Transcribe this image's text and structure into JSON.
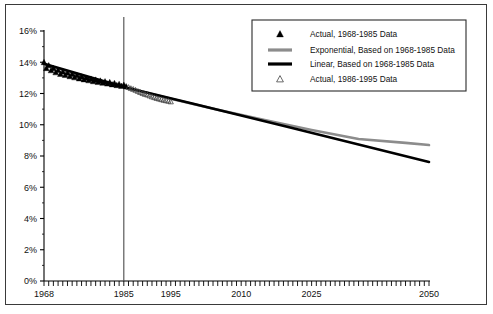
{
  "chart_data": {
    "type": "line",
    "title": "",
    "xlabel": "",
    "ylabel": "",
    "xlim": [
      1968,
      2050
    ],
    "ylim": [
      0,
      16
    ],
    "grid": false,
    "legend_position": "top-right",
    "y_tick_labels": [
      "0%",
      "2%",
      "4%",
      "6%",
      "8%",
      "10%",
      "12%",
      "14%",
      "16%"
    ],
    "y_ticks": [
      0,
      2,
      4,
      6,
      8,
      10,
      12,
      14,
      16
    ],
    "x_tick_labels": [
      "1968",
      "1985",
      "1995",
      "2010",
      "2025",
      "2050"
    ],
    "x_ticks": [
      1968,
      1985,
      1995,
      2010,
      2025,
      2050
    ],
    "x_minor_tick_interval": 1,
    "annotations": [
      {
        "name": "vertical-divider",
        "type": "vline",
        "x": 1985,
        "y_from": 0,
        "y_to": 16.9
      }
    ],
    "series": [
      {
        "name": "Actual, 1968-1985 Data",
        "type": "scatter",
        "marker": "filled-triangle",
        "color": "#000000",
        "x": [
          1968,
          1968.5,
          1969,
          1969.5,
          1970,
          1970.5,
          1971,
          1971.5,
          1972,
          1972.5,
          1973,
          1973.5,
          1974,
          1974.5,
          1975,
          1975.5,
          1976,
          1976.5,
          1977,
          1977.5,
          1978,
          1978.5,
          1979,
          1979.5,
          1980,
          1980.5,
          1981,
          1981.5,
          1982,
          1982.5,
          1983,
          1983.5,
          1984,
          1984.5,
          1985,
          1985.5
        ],
        "y": [
          14.0,
          13.62,
          13.8,
          13.48,
          13.62,
          13.35,
          13.5,
          13.25,
          13.4,
          13.18,
          13.32,
          13.1,
          13.24,
          13.03,
          13.16,
          12.96,
          13.08,
          12.9,
          13.0,
          12.84,
          12.94,
          12.78,
          12.88,
          12.73,
          12.82,
          12.68,
          12.77,
          12.63,
          12.72,
          12.58,
          12.66,
          12.53,
          12.6,
          12.48,
          12.55,
          12.45
        ]
      },
      {
        "name": "Exponential, Based on 1968-1985 Data",
        "type": "line",
        "color": "#8c8c8c",
        "line_width": 2.6,
        "x": [
          1968,
          1975,
          1985,
          1995,
          2005,
          2015,
          2025,
          2035,
          2045,
          2050
        ],
        "y": [
          13.88,
          13.23,
          12.42,
          11.67,
          10.96,
          10.3,
          9.67,
          9.09,
          8.84,
          8.7
        ]
      },
      {
        "name": "Linear, Based on 1968-1985 Data",
        "type": "line",
        "color": "#000000",
        "line_width": 2.6,
        "x": [
          1968,
          1985,
          2000,
          2020,
          2050
        ],
        "y": [
          13.9,
          12.42,
          11.33,
          9.85,
          7.62
        ]
      },
      {
        "name": "Actual, 1986-1995 Data",
        "type": "scatter",
        "marker": "open-triangle",
        "color": "#444444",
        "x": [
          1986,
          1986.5,
          1987,
          1987.5,
          1988,
          1988.5,
          1989,
          1989.5,
          1990,
          1990.5,
          1991,
          1991.5,
          1992,
          1992.5,
          1993,
          1993.5,
          1994,
          1994.5,
          1995
        ],
        "y": [
          12.4,
          12.33,
          12.28,
          12.22,
          12.15,
          12.08,
          12.02,
          11.96,
          11.92,
          11.86,
          11.8,
          11.75,
          11.7,
          11.66,
          11.62,
          11.58,
          11.55,
          11.52,
          11.48
        ]
      }
    ]
  },
  "legend": {
    "items": [
      {
        "marker": "filled-triangle",
        "label": "Actual, 1968-1985 Data"
      },
      {
        "marker": "gray-line",
        "label": "Exponential, Based on 1968-1985 Data"
      },
      {
        "marker": "black-line",
        "label": "Linear, Based on 1968-1985 Data"
      },
      {
        "marker": "open-triangle",
        "label": "Actual, 1986-1995 Data"
      }
    ]
  },
  "colors": {
    "border": "#3a3a3a",
    "axis": "#000000",
    "linear": "#000000",
    "exponential": "#8c8c8c",
    "background": "#ffffff"
  }
}
